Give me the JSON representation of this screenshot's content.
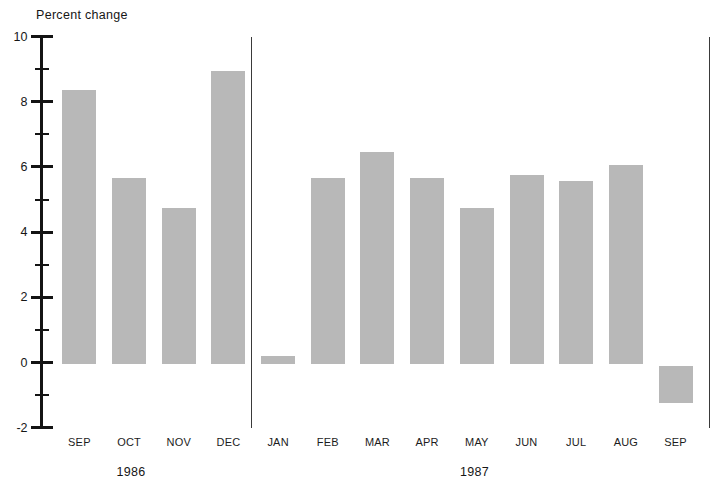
{
  "header": {
    "title": "Percent change"
  },
  "colors": {
    "bar": "#b8b8b8",
    "axis": "#141414",
    "divider": "#3a3a3a",
    "background": "#ffffff",
    "text": "#161616"
  },
  "chart_data": {
    "type": "bar",
    "title": "Percent change",
    "xlabel": "",
    "ylabel": "Percent change",
    "ylim": [
      -2,
      10
    ],
    "grid": false,
    "legend": null,
    "bar_color": "#b8b8b8",
    "y_axis": {
      "major_ticks": [
        10,
        8,
        6,
        4,
        2,
        0,
        -2
      ],
      "major_tick_labels": [
        "10",
        "8",
        "6",
        "4",
        "2",
        "0",
        "-2"
      ],
      "minor_ticks": [
        9,
        7,
        5,
        3,
        1,
        -1
      ]
    },
    "categories": [
      "SEP",
      "OCT",
      "NOV",
      "DEC",
      "JAN",
      "FEB",
      "MAR",
      "APR",
      "MAY",
      "JUN",
      "JUL",
      "AUG",
      "SEP"
    ],
    "values": [
      8.4,
      5.7,
      4.8,
      9.0,
      0.25,
      5.7,
      6.5,
      5.7,
      4.8,
      5.8,
      5.6,
      6.1,
      -1.2
    ],
    "group_labels": [
      {
        "label": "1986",
        "start_index": 0,
        "end_index": 3
      },
      {
        "label": "1987",
        "start_index": 4,
        "end_index": 12
      }
    ],
    "divider_after_index": [
      3,
      12
    ]
  }
}
